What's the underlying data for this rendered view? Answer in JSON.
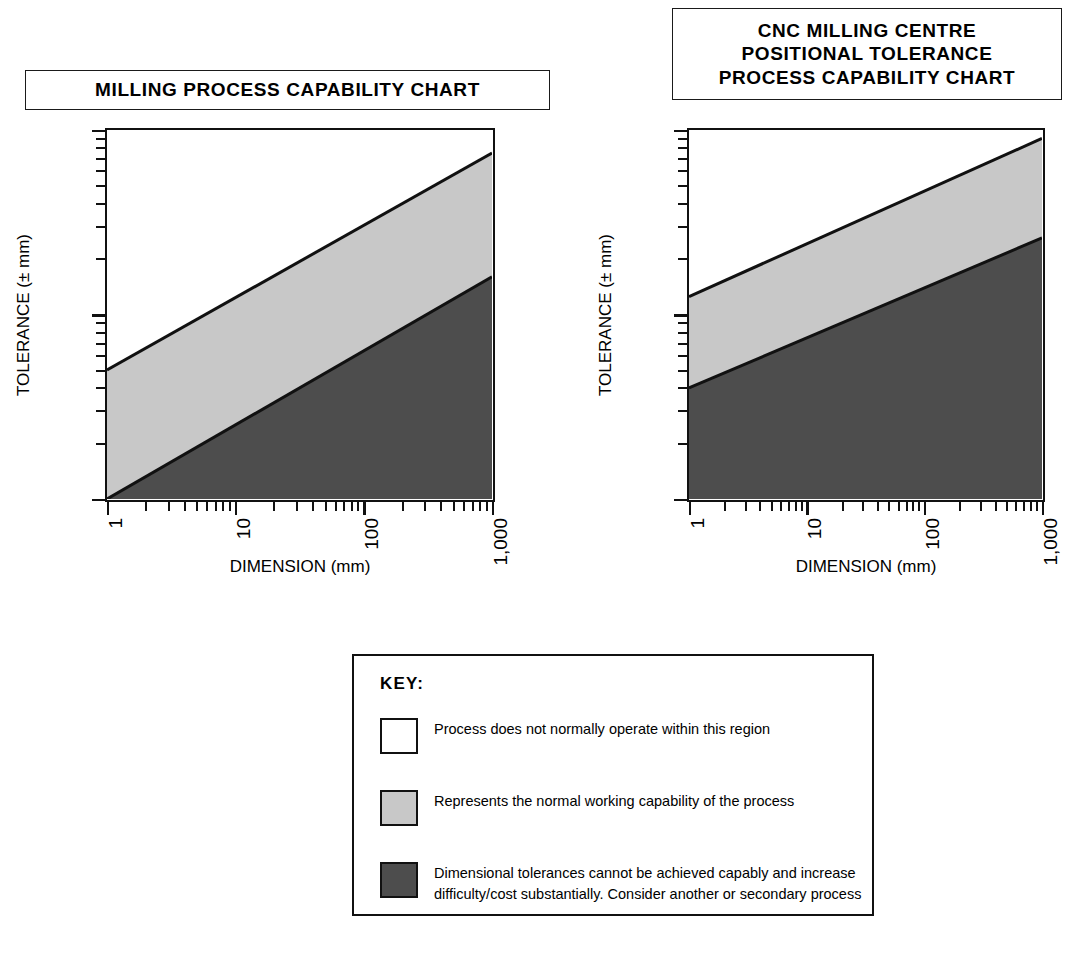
{
  "charts": [
    {
      "id": "milling",
      "title_lines": [
        "MILLING PROCESS CAPABILITY CHART"
      ],
      "xlabel": "DIMENSION (mm)",
      "ylabel": "TOLERANCE (± mm)",
      "xticks": [
        "1",
        "10",
        "100",
        "1,000"
      ],
      "yticks": [
        "0.01",
        "0.1",
        "1"
      ]
    },
    {
      "id": "cnc",
      "title_lines": [
        "CNC MILLING CENTRE",
        "POSITIONAL TOLERANCE",
        "PROCESS CAPABILITY CHART"
      ],
      "xlabel": "DIMENSION (mm)",
      "ylabel": "TOLERANCE (± mm)",
      "xticks": [
        "1",
        "10",
        "100",
        "1,000"
      ],
      "yticks": [
        "0.001",
        "0.01",
        "0.1"
      ]
    }
  ],
  "key": {
    "heading": "KEY:",
    "items": [
      {
        "swatch": "#ffffff",
        "text": "Process does not normally operate within this region"
      },
      {
        "swatch": "#c8c8c8",
        "text": "Represents the normal working capability of the process"
      },
      {
        "swatch": "#4d4d4d",
        "text": "Dimensional tolerances cannot be achieved capably and increase difficulty/cost substantially. Consider another or secondary process"
      }
    ]
  },
  "colors": {
    "band_normal": "#c8c8c8",
    "band_difficult": "#4d4d4d",
    "band_outside": "#ffffff",
    "line": "#111111"
  },
  "chart_data": [
    {
      "type": "area",
      "title": "MILLING PROCESS CAPABILITY CHART",
      "xlabel": "DIMENSION (mm)",
      "ylabel": "TOLERANCE (± mm)",
      "xscale": "log",
      "yscale": "log",
      "xlim": [
        1,
        1000
      ],
      "ylim": [
        0.01,
        1
      ],
      "xticks": [
        1,
        10,
        100,
        1000
      ],
      "xticklabels": [
        "1",
        "10",
        "100",
        "1,000"
      ],
      "yticks": [
        0.01,
        0.1,
        1
      ],
      "yticklabels": [
        "0.01",
        "0.1",
        "1"
      ],
      "grid": false,
      "legend": "KEY box below charts",
      "series": [
        {
          "name": "Upper capability boundary",
          "x": [
            1,
            1000
          ],
          "y": [
            0.05,
            0.75
          ],
          "note": "Boundary between region where process does not normally operate and normal working capability"
        },
        {
          "name": "Lower capability boundary",
          "x": [
            1,
            1000
          ],
          "y": [
            0.01,
            0.16
          ],
          "note": "Boundary between normal working capability and region of difficult/costly tolerances"
        }
      ],
      "regions": [
        {
          "name": "Process does not normally operate within this region",
          "fill": "#ffffff",
          "position": "above upper boundary"
        },
        {
          "name": "Represents the normal working capability of the process",
          "fill": "#c8c8c8",
          "position": "between boundaries"
        },
        {
          "name": "Dimensional tolerances cannot be achieved capably and increase difficulty/cost substantially",
          "fill": "#4d4d4d",
          "position": "below lower boundary"
        }
      ]
    },
    {
      "type": "area",
      "title": "CNC MILLING CENTRE POSITIONAL TOLERANCE PROCESS CAPABILITY CHART",
      "xlabel": "DIMENSION (mm)",
      "ylabel": "TOLERANCE (± mm)",
      "xscale": "log",
      "yscale": "log",
      "xlim": [
        1,
        1000
      ],
      "ylim": [
        0.001,
        0.1
      ],
      "xticks": [
        1,
        10,
        100,
        1000
      ],
      "xticklabels": [
        "1",
        "10",
        "100",
        "1,000"
      ],
      "yticks": [
        0.001,
        0.01,
        0.1
      ],
      "yticklabels": [
        "0.001",
        "0.01",
        "0.1"
      ],
      "grid": false,
      "legend": "KEY box below charts",
      "series": [
        {
          "name": "Upper capability boundary",
          "x": [
            1,
            1000
          ],
          "y": [
            0.0125,
            0.09
          ],
          "note": "Boundary between region where process does not normally operate and normal working capability"
        },
        {
          "name": "Lower capability boundary",
          "x": [
            1,
            1000
          ],
          "y": [
            0.004,
            0.026
          ],
          "note": "Boundary between normal working capability and region of difficult/costly tolerances"
        }
      ],
      "regions": [
        {
          "name": "Process does not normally operate within this region",
          "fill": "#ffffff",
          "position": "above upper boundary"
        },
        {
          "name": "Represents the normal working capability of the process",
          "fill": "#c8c8c8",
          "position": "between boundaries"
        },
        {
          "name": "Dimensional tolerances cannot be achieved capably and increase difficulty/cost substantially",
          "fill": "#4d4d4d",
          "position": "below lower boundary"
        }
      ]
    }
  ]
}
